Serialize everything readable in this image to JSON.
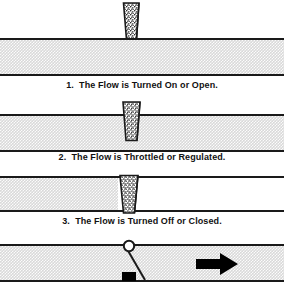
{
  "diagram": {
    "pipe_fill_color": "#d9d9d9",
    "line_color": "#1a1a1a",
    "wedge_fill_color": "#ffffff",
    "arrow_color": "#000000"
  },
  "panels": [
    {
      "id": "panel-open",
      "caption": "1.  The Flow is Turned On or Open.",
      "gate_state": "open",
      "gate_insertion": "above-pipe",
      "flow_blocked": false
    },
    {
      "id": "panel-throttled",
      "caption": "2.  The Flow is Throttled or Regulated.",
      "gate_state": "throttled",
      "gate_insertion": "partial",
      "flow_blocked": false
    },
    {
      "id": "panel-closed",
      "caption": "3.  The Flow is Turned Off or Closed.",
      "gate_state": "closed",
      "gate_insertion": "full",
      "flow_blocked": true
    }
  ],
  "schematic": {
    "id": "panel-schematic",
    "handwheel_label": "pivot-circle",
    "stem_label": "valve-stem",
    "block_label": "valve-block",
    "arrow_label": "flow-direction-arrow",
    "arrow_direction": "right"
  }
}
